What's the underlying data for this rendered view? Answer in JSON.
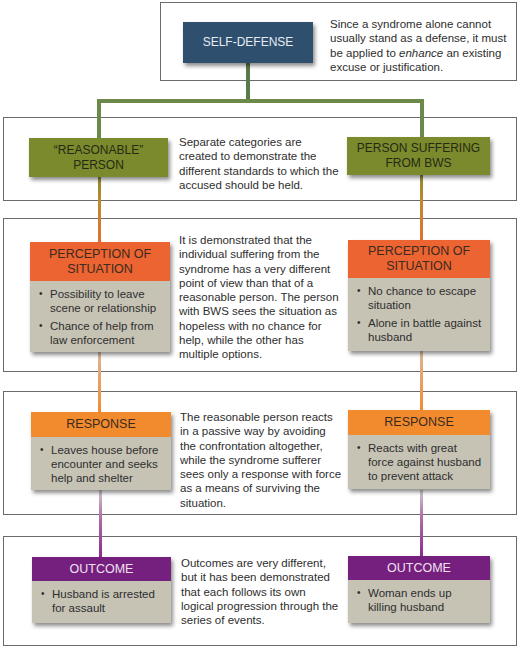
{
  "colors": {
    "navy": "#2f4f6f",
    "olive": "#7a8a2c",
    "connector_green": "#6b8a4a",
    "perception_orange": "#ec6431",
    "response_orange": "#f28a2e",
    "outcome_purple": "#75207e",
    "card_body": "#c6c3b5"
  },
  "top": {
    "node_label": "SELF-DEFENSE",
    "description_pre": "Since a syndrome alone cannot usually stand as a defense, it must be applied to ",
    "description_em": "enhance",
    "description_post": " an existing excuse or justification."
  },
  "categories": {
    "left_label": "“REASONABLE” PERSON",
    "right_label": "PERSON SUFFERING FROM BWS",
    "description": "Separate categories are created to demonstrate the different standards to which the accused should be held."
  },
  "perception": {
    "left": {
      "title": "PERCEPTION OF SITUATION",
      "bullets": [
        "Possibility to leave scene or relationship",
        "Chance of help from law enforcement"
      ]
    },
    "right": {
      "title": "PERCEPTION OF SITUATION",
      "bullets": [
        "No chance to escape situation",
        "Alone in battle against husband"
      ]
    },
    "description": "It is demonstrated that the individual suffering from the syndrome has a very different point of view than that of a reasonable person. The person with BWS sees the situation as hopeless with no chance for help, while the other has multiple options."
  },
  "response": {
    "left": {
      "title": "RESPONSE",
      "bullets": [
        "Leaves house before encounter and seeks help and shelter"
      ]
    },
    "right": {
      "title": "RESPONSE",
      "bullets": [
        "Reacts with great force against husband to prevent attack"
      ]
    },
    "description": "The reasonable person reacts in a passive way by avoiding the confrontation altogether, while the syndrome sufferer sees only a response with force as a means of surviving the situation."
  },
  "outcome": {
    "left": {
      "title": "OUTCOME",
      "bullets": [
        "Husband is arrested for assault"
      ]
    },
    "right": {
      "title": "OUTCOME",
      "bullets": [
        "Woman ends up killing husband"
      ]
    },
    "description": "Outcomes are very different, but it has been demonstrated that each follows its own logical progression through the series of events."
  }
}
